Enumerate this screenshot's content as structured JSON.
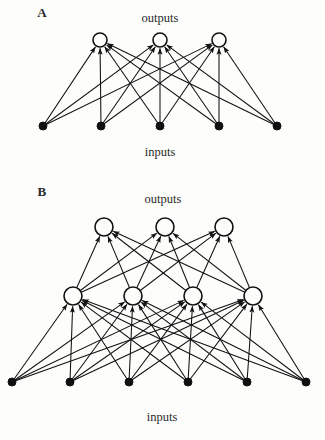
{
  "figure": {
    "background_color": "#fdfdfc",
    "ink_color": "#111111",
    "width": 325,
    "height": 440
  },
  "panels": [
    {
      "id": "panel-a",
      "letter": "A",
      "letter_pos": {
        "x": 42,
        "y": 17
      },
      "top_label": "outputs",
      "top_label_pos": {
        "x": 160,
        "y": 22
      },
      "bottom_label": "inputs",
      "bottom_label_pos": {
        "x": 160,
        "y": 156
      },
      "description": "Two-layer perceptron: 5 inputs fully connected to 3 outputs",
      "layers": [
        {
          "name": "outputs",
          "node_style": "open-circle",
          "radius": 7,
          "y": 40,
          "nodes": [
            {
              "id": "a-out-1",
              "x": 100,
              "y": 40
            },
            {
              "id": "a-out-2",
              "x": 160,
              "y": 40
            },
            {
              "id": "a-out-3",
              "x": 219,
              "y": 40
            }
          ]
        },
        {
          "name": "inputs",
          "node_style": "filled-dot",
          "radius": 4,
          "y": 126,
          "nodes": [
            {
              "id": "a-in-1",
              "x": 43,
              "y": 126
            },
            {
              "id": "a-in-2",
              "x": 101,
              "y": 126
            },
            {
              "id": "a-in-3",
              "x": 160,
              "y": 126
            },
            {
              "id": "a-in-4",
              "x": 219,
              "y": 126
            },
            {
              "id": "a-in-5",
              "x": 277,
              "y": 126
            }
          ]
        }
      ],
      "connections": {
        "from_layer": "inputs",
        "to_layer": "outputs",
        "pattern": "fully-connected",
        "arrow_direction": "upward",
        "edge_count": 15
      }
    },
    {
      "id": "panel-b",
      "letter": "B",
      "letter_pos": {
        "x": 42,
        "y": 196
      },
      "top_label": "outputs",
      "top_label_pos": {
        "x": 163,
        "y": 203
      },
      "bottom_label": "inputs",
      "bottom_label_pos": {
        "x": 162,
        "y": 421
      },
      "description": "Three-layer network: 6 inputs to 4 hidden units to 3 outputs",
      "layers": [
        {
          "name": "outputs",
          "node_style": "open-circle",
          "radius": 9,
          "y": 227,
          "nodes": [
            {
              "id": "b-out-1",
              "x": 104,
              "y": 227
            },
            {
              "id": "b-out-2",
              "x": 165,
              "y": 227
            },
            {
              "id": "b-out-3",
              "x": 224,
              "y": 227
            }
          ]
        },
        {
          "name": "hidden",
          "node_style": "open-circle",
          "radius": 9,
          "y": 296,
          "nodes": [
            {
              "id": "b-hid-1",
              "x": 73,
              "y": 296
            },
            {
              "id": "b-hid-2",
              "x": 133,
              "y": 296
            },
            {
              "id": "b-hid-3",
              "x": 193,
              "y": 296
            },
            {
              "id": "b-hid-4",
              "x": 253,
              "y": 296
            }
          ]
        },
        {
          "name": "inputs",
          "node_style": "filled-dot",
          "radius": 4,
          "y": 382,
          "nodes": [
            {
              "id": "b-in-1",
              "x": 12,
              "y": 382
            },
            {
              "id": "b-in-2",
              "x": 70,
              "y": 382
            },
            {
              "id": "b-in-3",
              "x": 129,
              "y": 382
            },
            {
              "id": "b-in-4",
              "x": 188,
              "y": 382
            },
            {
              "id": "b-in-5",
              "x": 247,
              "y": 382
            },
            {
              "id": "b-in-6",
              "x": 306,
              "y": 382
            }
          ]
        }
      ],
      "connections": [
        {
          "from_layer": "inputs",
          "to_layer": "hidden",
          "pattern": "fully-connected",
          "arrow_direction": "upward",
          "edge_count": 24
        },
        {
          "from_layer": "hidden",
          "to_layer": "outputs",
          "pattern": "fully-connected",
          "arrow_direction": "upward",
          "edge_count": 12
        }
      ]
    }
  ]
}
